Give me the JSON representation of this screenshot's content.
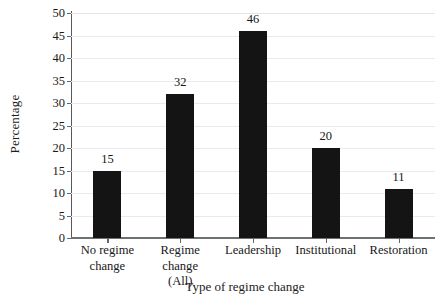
{
  "chart_data": {
    "type": "bar",
    "title": "",
    "subtitle": "",
    "xlabel": "Type of regime change",
    "ylabel": "Percentage",
    "categories": [
      "No regime change",
      "Regime change (All)",
      "Leadership",
      "Institutional",
      "Restoration"
    ],
    "category_lines": [
      [
        "No regime",
        "change"
      ],
      [
        "Regime",
        "change",
        "(All)"
      ],
      [
        "Leadership"
      ],
      [
        "Institutional"
      ],
      [
        "Restoration"
      ]
    ],
    "values": [
      15,
      32,
      46,
      20,
      11
    ],
    "value_labels": [
      "15",
      "32",
      "46",
      "20",
      "11"
    ],
    "ylim": [
      0,
      50
    ],
    "ytick_values": [
      0,
      5,
      10,
      15,
      20,
      25,
      30,
      35,
      40,
      45,
      50
    ],
    "ytick_labels": [
      "0",
      "5",
      "10",
      "15",
      "20",
      "25",
      "30",
      "35",
      "40",
      "45",
      "50"
    ],
    "grid": true,
    "grid_axis": "y",
    "legend": false,
    "legend_position": "none",
    "bar_color": "#141414",
    "grid_color": "#e9eaec",
    "axis_color": "#62676a",
    "background_color": "#ffffff",
    "text_color": "#181818"
  }
}
